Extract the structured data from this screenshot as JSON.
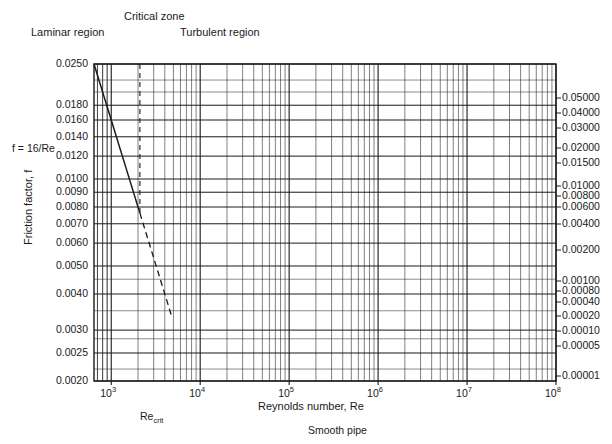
{
  "figure": {
    "type": "moody-diagram",
    "y_axis_title": "Friction factor, f",
    "x_axis_title": "Reynolds number, Re",
    "laminar_formula": "f = 16/Re",
    "re_crit_label_base": "Re",
    "re_crit_label_sub": "crit",
    "smooth_pipe_label": "Smooth pipe"
  },
  "regions": {
    "laminar": "Laminar region",
    "critical": "Critical zone",
    "turbulent": "Turbulent region"
  },
  "chart_data": {
    "type": "line",
    "title": "",
    "xlabel": "Reynolds number, Re",
    "ylabel": "Friction factor, f",
    "xscale": "log",
    "yscale": "log",
    "xlim": [
      640,
      100000000
    ],
    "ylim": [
      0.002,
      0.025
    ],
    "grid": true,
    "legend_position": "right-axis-labels",
    "x_tick_labels": [
      "10³",
      "10⁴",
      "10⁵",
      "10⁶",
      "10⁷",
      "10⁸"
    ],
    "x_tick_values": [
      1000,
      10000,
      100000,
      1000000,
      10000000,
      100000000
    ],
    "y_tick_labels": [
      "0.0250",
      "0.0180",
      "0.0160",
      "0.0140",
      "0.0120",
      "0.0100",
      "0.0090",
      "0.0080",
      "0.0070",
      "0.0060",
      "0.0050",
      "0.0040",
      "0.0030",
      "0.0025",
      "0.0020"
    ],
    "y_tick_values": [
      0.025,
      0.018,
      0.016,
      0.014,
      0.012,
      0.01,
      0.009,
      0.008,
      0.007,
      0.006,
      0.005,
      0.004,
      0.003,
      0.0025,
      0.002
    ],
    "right_axis_labels": [
      "0.05000",
      "0.04000",
      "0.03000",
      "0.02000",
      "0.01500",
      "0.01000",
      "0.00800",
      "0.00600",
      "0.00400",
      "0.00200",
      "0.00100",
      "0.00080",
      "0.00040",
      "0.00020",
      "0.00010",
      "0.00005",
      "0.00001"
    ],
    "right_axis_values": [
      0.05,
      0.04,
      0.03,
      0.02,
      0.015,
      0.01,
      0.008,
      0.006,
      0.004,
      0.002,
      0.001,
      0.0008,
      0.0004,
      0.0002,
      0.0001,
      5e-05,
      1e-05
    ],
    "annotations": [
      {
        "text": "0.000005",
        "x": 10000000,
        "y": 0.00245
      },
      {
        "text": "0.000001",
        "x": 6000000,
        "y": 0.0023
      },
      {
        "text": "Smooth pipe",
        "x": 900000,
        "y": 0.0022
      }
    ],
    "series": [
      {
        "name": "laminar",
        "note": "f = 16/Re",
        "style": "solid",
        "x": [
          640,
          2100
        ],
        "y": [
          0.025,
          0.00762
        ]
      },
      {
        "name": "laminar-extension",
        "style": "dashed",
        "x": [
          2100,
          4800
        ],
        "y": [
          0.00762,
          0.00333
        ]
      },
      {
        "name": "roughness-0.05000",
        "values_f_end": 0.0172
      },
      {
        "name": "roughness-0.04000",
        "values_f_end": 0.0161
      },
      {
        "name": "roughness-0.03000",
        "values_f_end": 0.0145
      },
      {
        "name": "roughness-0.02000",
        "values_f_end": 0.0124
      },
      {
        "name": "roughness-0.01500",
        "values_f_end": 0.0113
      },
      {
        "name": "roughness-0.01000",
        "values_f_end": 0.0099
      },
      {
        "name": "roughness-0.00800",
        "values_f_end": 0.0092
      },
      {
        "name": "roughness-0.00600",
        "values_f_end": 0.0085
      },
      {
        "name": "roughness-0.00400",
        "values_f_end": 0.0076
      },
      {
        "name": "roughness-0.00200",
        "values_f_end": 0.0063
      },
      {
        "name": "roughness-0.00100",
        "values_f_end": 0.0052
      },
      {
        "name": "roughness-0.00080",
        "values_f_end": 0.0049
      },
      {
        "name": "roughness-0.00040",
        "values_f_end": 0.0043
      },
      {
        "name": "roughness-0.00020",
        "values_f_end": 0.0038
      },
      {
        "name": "roughness-0.00010",
        "values_f_end": 0.0034
      },
      {
        "name": "roughness-0.00005",
        "values_f_end": 0.0031
      },
      {
        "name": "roughness-0.00001",
        "values_f_end": 0.0025
      },
      {
        "name": "smooth-pipe",
        "values_f_end": 0.00205
      }
    ]
  }
}
